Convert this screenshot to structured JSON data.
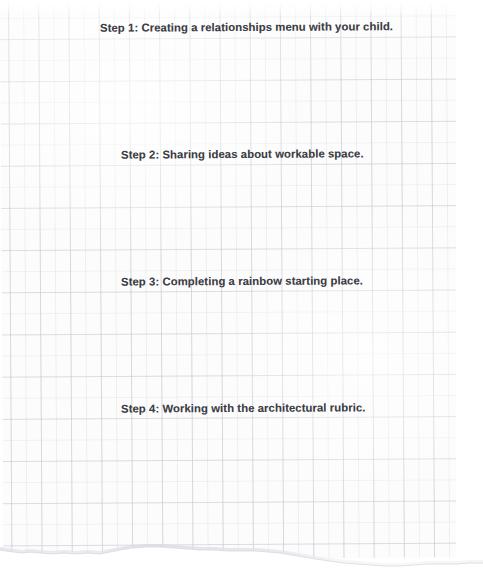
{
  "document": {
    "kind": "scanned-grid-paper-worksheet",
    "paper": {
      "style": "graph-paper",
      "grid_color": "#c4c7ce",
      "paper_color": "#fcfcfd",
      "background_color": "#ffffff",
      "bottom_edge": "torn"
    },
    "text_color": "#3c3c44"
  },
  "steps": [
    {
      "id": "step-1",
      "label": "Step 1:  Creating a relationships menu with your child."
    },
    {
      "id": "step-2",
      "label": "Step 2:  Sharing ideas about workable space."
    },
    {
      "id": "step-3",
      "label": "Step 3:  Completing a rainbow starting place."
    },
    {
      "id": "step-4",
      "label": "Step 4:  Working with the architectural rubric."
    }
  ]
}
